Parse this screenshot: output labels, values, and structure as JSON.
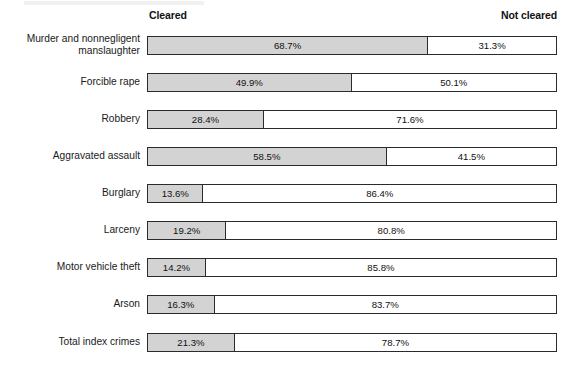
{
  "header": {
    "cleared_label": "Cleared",
    "not_cleared_label": "Not cleared"
  },
  "chart_data": {
    "type": "bar",
    "orientation": "horizontal",
    "stacked": true,
    "percent": true,
    "title": "",
    "subtitle": "",
    "xlabel": "",
    "ylabel": "",
    "xlim": [
      0,
      100
    ],
    "grid": false,
    "legend_position": "top",
    "legend": [
      "Cleared",
      "Not cleared"
    ],
    "categories": [
      "Murder and nonnegligent\nmanslaughter",
      "Forcible rape",
      "Robbery",
      "Aggravated assault",
      "Burglary",
      "Larceny",
      "Motor vehicle theft",
      "Arson",
      "Total index crimes"
    ],
    "series": [
      {
        "name": "Cleared",
        "color": "#d3d3d3",
        "values": [
          68.7,
          49.9,
          28.4,
          58.5,
          13.6,
          19.2,
          14.2,
          16.3,
          21.3
        ],
        "labels": [
          "68.7%",
          "49.9%",
          "28.4%",
          "58.5%",
          "13.6%",
          "19.2%",
          "14.2%",
          "16.3%",
          "21.3%"
        ]
      },
      {
        "name": "Not cleared",
        "color": "#ffffff",
        "values": [
          31.3,
          50.1,
          71.6,
          41.5,
          86.4,
          80.8,
          85.8,
          83.7,
          78.7
        ],
        "labels": [
          "31.3%",
          "50.1%",
          "71.6%",
          "41.5%",
          "86.4%",
          "80.8%",
          "85.8%",
          "83.7%",
          "78.7%"
        ]
      }
    ]
  },
  "rows": [
    {
      "label": "Murder and nonnegligent\nmanslaughter",
      "two_line": true,
      "cleared": 68.7,
      "not_cleared": 31.3,
      "cleared_label": "68.7%",
      "not_cleared_label": "31.3%",
      "top": 36
    },
    {
      "label": "Forcible rape",
      "two_line": false,
      "cleared": 49.9,
      "not_cleared": 50.1,
      "cleared_label": "49.9%",
      "not_cleared_label": "50.1%",
      "top": 73
    },
    {
      "label": "Robbery",
      "two_line": false,
      "cleared": 28.4,
      "not_cleared": 71.6,
      "cleared_label": "28.4%",
      "not_cleared_label": "71.6%",
      "top": 110
    },
    {
      "label": "Aggravated assault",
      "two_line": false,
      "cleared": 58.5,
      "not_cleared": 41.5,
      "cleared_label": "58.5%",
      "not_cleared_label": "41.5%",
      "top": 147
    },
    {
      "label": "Burglary",
      "two_line": false,
      "cleared": 13.6,
      "not_cleared": 86.4,
      "cleared_label": "13.6%",
      "not_cleared_label": "86.4%",
      "top": 184
    },
    {
      "label": "Larceny",
      "two_line": false,
      "cleared": 19.2,
      "not_cleared": 80.8,
      "cleared_label": "19.2%",
      "not_cleared_label": "80.8%",
      "top": 221
    },
    {
      "label": "Motor vehicle theft",
      "two_line": false,
      "cleared": 14.2,
      "not_cleared": 85.8,
      "cleared_label": "14.2%",
      "not_cleared_label": "85.8%",
      "top": 258
    },
    {
      "label": "Arson",
      "two_line": false,
      "cleared": 16.3,
      "not_cleared": 83.7,
      "cleared_label": "16.3%",
      "not_cleared_label": "83.7%",
      "top": 295
    },
    {
      "label": "Total index crimes",
      "two_line": false,
      "cleared": 21.3,
      "not_cleared": 78.7,
      "cleared_label": "21.3%",
      "not_cleared_label": "78.7%",
      "top": 333
    }
  ]
}
